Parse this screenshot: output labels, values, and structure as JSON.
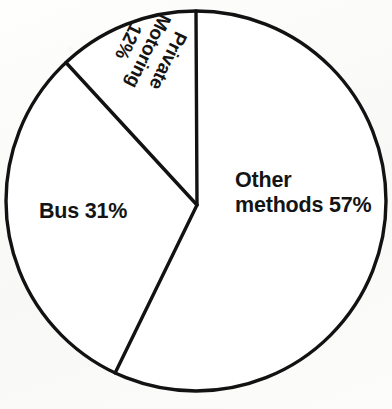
{
  "chart_data": {
    "type": "pie",
    "title": "",
    "subtitle": "",
    "xlabel": "",
    "ylabel": "",
    "legend_position": "none",
    "grid": false,
    "units": "percent",
    "categories": [
      "Other methods",
      "Bus",
      "Private Motoring"
    ],
    "values": [
      57,
      31,
      12
    ],
    "slices": [
      {
        "name": "Other methods",
        "value": 57,
        "value_label": "57%",
        "label_lines": [
          "Other",
          "methods 57%"
        ],
        "start_angle_deg": 0,
        "end_angle_deg": 205.2,
        "fill": "#ffffff",
        "stroke": "#121212"
      },
      {
        "name": "Bus",
        "value": 31,
        "value_label": "31%",
        "label_lines": [
          "Bus 31%"
        ],
        "start_angle_deg": 205.2,
        "end_angle_deg": 316.8,
        "fill": "#ffffff",
        "stroke": "#121212"
      },
      {
        "name": "Private Motoring",
        "value": 12,
        "value_label": "12%",
        "label_lines": [
          "Private",
          "Motoring",
          "12%"
        ],
        "start_angle_deg": 316.8,
        "end_angle_deg": 360,
        "fill": "#ffffff",
        "stroke": "#121212"
      }
    ],
    "total": 100,
    "geometry": {
      "center_x": 196,
      "center_y": 201,
      "radius": 190,
      "vertex_x": 197,
      "vertex_y": 205,
      "stroke_width": 3.4
    },
    "colors": {
      "outline": "#121212",
      "slice_fill": "#ffffff",
      "text": "#141414",
      "background": "#fdfdfb"
    }
  },
  "labels": {
    "other": {
      "line1": "Other",
      "line2": "methods 57%"
    },
    "bus": {
      "line1": "Bus 31%"
    },
    "private": {
      "line1": "Private",
      "line2": "Motoring",
      "line3": "12%"
    }
  }
}
